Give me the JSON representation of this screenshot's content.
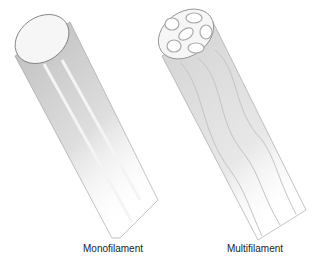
{
  "figure": {
    "items": [
      {
        "id": "monofilament",
        "label": "Monofilament"
      },
      {
        "id": "multifilament",
        "label": "Multifilament"
      }
    ]
  }
}
